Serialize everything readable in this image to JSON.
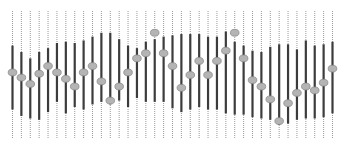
{
  "chart_data": {
    "type": "range",
    "title": "",
    "xlabel": "",
    "ylabel": "",
    "ylim": [
      0,
      100
    ],
    "grid": false,
    "legend": "none",
    "colors": {
      "range": "#3c3c3c",
      "marker": "#b4b4b4",
      "marker_edge": "#8c8c8c",
      "guide": "#9a9a9a"
    },
    "categories": [
      1,
      2,
      3,
      4,
      5,
      6,
      7,
      8,
      9,
      10,
      11,
      12,
      13,
      14,
      15,
      16,
      17,
      18,
      19,
      20,
      21,
      22,
      23,
      24,
      25,
      26,
      27,
      28,
      29,
      30,
      31,
      32,
      33,
      34,
      35,
      36,
      37
    ],
    "series": [
      {
        "name": "high",
        "values": [
          73,
          68,
          63,
          68,
          71,
          75,
          76,
          75,
          77,
          80,
          83,
          83,
          78,
          73,
          71,
          76,
          78,
          80,
          81,
          82,
          82,
          82,
          80,
          80,
          84,
          76,
          73,
          69,
          68,
          72,
          74,
          74,
          70,
          77,
          73,
          74,
          76
        ]
      },
      {
        "name": "low",
        "values": [
          23,
          18,
          16,
          15,
          21,
          29,
          20,
          25,
          23,
          27,
          29,
          27,
          30,
          25,
          32,
          29,
          29,
          29,
          24,
          21,
          23,
          25,
          23,
          23,
          20,
          19,
          19,
          17,
          16,
          15,
          11,
          12,
          15,
          16,
          16,
          17,
          20
        ]
      },
      {
        "name": "marker",
        "values": [
          52,
          48,
          43,
          51,
          57,
          52,
          47,
          41,
          52,
          57,
          45,
          30,
          41,
          52,
          63,
          67,
          83,
          67,
          57,
          40,
          50,
          61,
          50,
          61,
          69,
          83,
          63,
          46,
          41,
          31,
          14,
          28,
          36,
          41,
          38,
          44,
          55
        ]
      }
    ]
  }
}
